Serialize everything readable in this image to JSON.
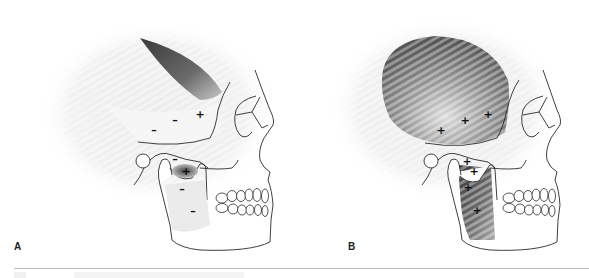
{
  "figure": {
    "panels": [
      {
        "id": "A",
        "label": "A",
        "description": "Lateral skull with temporalis and masseter/pterygoid regions marked by activity signs",
        "signs": [
          {
            "symbol": "+",
            "x": 200,
            "y": 115,
            "region": "temporalis-anterior"
          },
          {
            "symbol": "–",
            "x": 175,
            "y": 121,
            "region": "temporalis-middle"
          },
          {
            "symbol": "–",
            "x": 154,
            "y": 131,
            "region": "temporalis-posterior"
          },
          {
            "symbol": "–",
            "x": 175,
            "y": 160,
            "region": "lateral-pterygoid-upper"
          },
          {
            "symbol": "+",
            "x": 186,
            "y": 172,
            "region": "lateral-pterygoid-lower"
          },
          {
            "symbol": "–",
            "x": 182,
            "y": 190,
            "region": "masseter-deep"
          },
          {
            "symbol": "–",
            "x": 193,
            "y": 212,
            "region": "masseter-superficial"
          }
        ],
        "shaded_regions": [
          "temporalis-anterior-wedge",
          "lateral-pterygoid"
        ]
      },
      {
        "id": "B",
        "label": "B",
        "description": "Lateral skull with full temporalis and masseter shading, all regions positive",
        "signs": [
          {
            "symbol": "+",
            "x": 146,
            "y": 131,
            "region": "temporalis-posterior"
          },
          {
            "symbol": "+",
            "x": 170,
            "y": 121,
            "region": "temporalis-middle"
          },
          {
            "symbol": "+",
            "x": 193,
            "y": 115,
            "region": "temporalis-anterior"
          },
          {
            "symbol": "+",
            "x": 172,
            "y": 162,
            "region": "lateral-pterygoid-upper"
          },
          {
            "symbol": "+",
            "x": 179,
            "y": 172,
            "region": "lateral-pterygoid-lower"
          },
          {
            "symbol": "+",
            "x": 173,
            "y": 188,
            "region": "masseter-deep"
          },
          {
            "symbol": "+",
            "x": 182,
            "y": 211,
            "region": "masseter-superficial"
          }
        ],
        "shaded_regions": [
          "temporalis-full",
          "lateral-pterygoid",
          "masseter"
        ]
      }
    ],
    "colors": {
      "outline": "#2a2a2a",
      "shade_dark": "#4a4a4a",
      "shade_mid": "#8a8a8a",
      "halo": "#e6e6e6",
      "rule": "#bdbdbd"
    }
  }
}
